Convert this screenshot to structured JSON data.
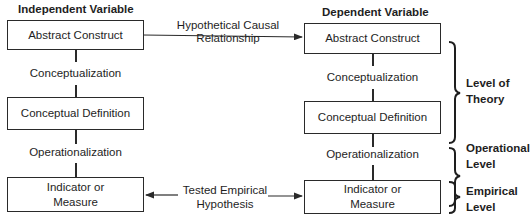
{
  "diagram": {
    "independent": {
      "heading": "Independent Variable",
      "abstract_construct": "Abstract Construct",
      "conceptualization": "Conceptualization",
      "conceptual_definition": "Conceptual Definition",
      "operationalization": "Operationalization",
      "indicator_line1": "Indicator or",
      "indicator_line2": "Measure"
    },
    "dependent": {
      "heading": "Dependent Variable",
      "abstract_construct": "Abstract Construct",
      "conceptualization": "Conceptualization",
      "conceptual_definition": "Conceptual Definition",
      "operationalization": "Operationalization",
      "indicator_line1": "Indicator or",
      "indicator_line2": "Measure"
    },
    "links": {
      "causal_line1": "Hypothetical Causal",
      "causal_line2": "Relationship",
      "empirical_line1": "Tested Empirical",
      "empirical_line2": "Hypothesis"
    },
    "levels": [
      {
        "line1": "Level of",
        "line2": "Theory"
      },
      {
        "line1": "Operational",
        "line2": "Level"
      },
      {
        "line1": "Empirical",
        "line2": "Level"
      }
    ],
    "colors": {
      "stroke": "#2a2a2a",
      "text": "#1e1e1e",
      "background": "#ffffff"
    }
  }
}
